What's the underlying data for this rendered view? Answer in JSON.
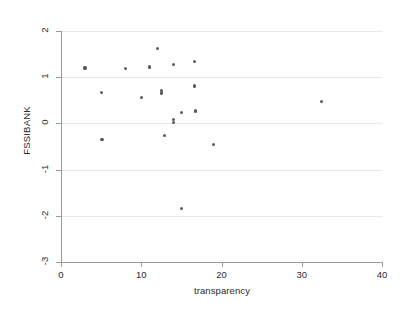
{
  "chart_data": {
    "type": "scatter",
    "title": "",
    "xlabel": "transparency",
    "ylabel": "FSSIBANK",
    "xlim": [
      0,
      40
    ],
    "ylim": [
      -3,
      2
    ],
    "xticks": [
      0,
      10,
      20,
      30,
      40
    ],
    "yticks": [
      2,
      1,
      0,
      -1,
      -2,
      -3
    ],
    "xtick_labels": [
      "0",
      "10",
      "20",
      "30",
      "40"
    ],
    "ytick_labels": [
      "2",
      "1",
      "0",
      "-1",
      "-2",
      "-3"
    ],
    "grid": "horizontal",
    "legend": "none",
    "marker_color": "#555a63",
    "grid_color": "#e8e8e8",
    "axis_color": "#9a9a9a",
    "background_color": "#ffffff",
    "series": [
      {
        "name": "observations",
        "points": [
          {
            "x": 3.0,
            "y": 1.2
          },
          {
            "x": 5.0,
            "y": 0.67
          },
          {
            "x": 5.1,
            "y": -0.35
          },
          {
            "x": 8.0,
            "y": 1.19
          },
          {
            "x": 10.0,
            "y": 0.56
          },
          {
            "x": 11.0,
            "y": 1.22
          },
          {
            "x": 12.0,
            "y": 1.63
          },
          {
            "x": 12.5,
            "y": 0.72
          },
          {
            "x": 12.5,
            "y": 0.66
          },
          {
            "x": 12.9,
            "y": -0.26
          },
          {
            "x": 14.0,
            "y": 1.28
          },
          {
            "x": 14.0,
            "y": 0.08
          },
          {
            "x": 14.0,
            "y": 0.02
          },
          {
            "x": 15.0,
            "y": 0.24
          },
          {
            "x": 15.0,
            "y": -1.85
          },
          {
            "x": 16.6,
            "y": 1.34
          },
          {
            "x": 16.6,
            "y": 0.81
          },
          {
            "x": 16.8,
            "y": 0.27
          },
          {
            "x": 19.0,
            "y": -0.45
          },
          {
            "x": 32.5,
            "y": 0.48
          }
        ]
      }
    ]
  }
}
